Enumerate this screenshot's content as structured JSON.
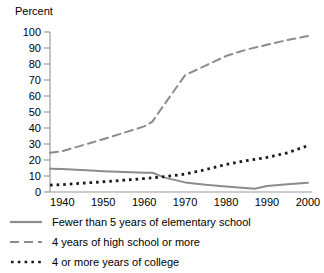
{
  "chart_data": {
    "type": "line",
    "title": "",
    "ylabel": "Percent",
    "xlabel": "",
    "ylim": [
      0,
      100
    ],
    "xlim": [
      1937,
      2001
    ],
    "grid": false,
    "legend_position": "below",
    "y_ticks": [
      0,
      10,
      20,
      30,
      40,
      50,
      60,
      70,
      80,
      90,
      100
    ],
    "y_tick_labels": [
      "0",
      "10",
      "20",
      "30",
      "40",
      "50",
      "60",
      "70",
      "80",
      "90",
      "100"
    ],
    "x_ticks": [
      1940,
      1950,
      1960,
      1970,
      1980,
      1990,
      2000
    ],
    "x_tick_labels": [
      "1940",
      "1950",
      "1960",
      "1970",
      "1980",
      "1990",
      "2000"
    ],
    "series": [
      {
        "name": "Fewer than 5 years of elementary school",
        "style": "solid",
        "color": "#8c8c8c",
        "x": [
          1937,
          1940,
          1947,
          1950,
          1957,
          1960,
          1962,
          1965,
          1970,
          1975,
          1980,
          1987,
          1990,
          1995,
          2000
        ],
        "values": [
          14.6,
          14.4,
          13.4,
          13.0,
          12.3,
          12.1,
          12.0,
          9.0,
          6.0,
          4.6,
          3.5,
          2.0,
          3.8,
          4.8,
          5.8
        ]
      },
      {
        "name": "4 years of high school or more",
        "style": "dashed",
        "color": "#8c8c8c",
        "x": [
          1937,
          1940,
          1950,
          1960,
          1962,
          1965,
          1970,
          1975,
          1980,
          1985,
          1990,
          1995,
          2000
        ],
        "values": [
          24.5,
          25.5,
          33.0,
          41.0,
          44.0,
          55.0,
          73.0,
          79.0,
          85.0,
          89.0,
          92.0,
          95.0,
          97.5
        ]
      },
      {
        "name": "4 or more years of college",
        "style": "dotted",
        "color": "#1a1a1a",
        "x": [
          1937,
          1940,
          1950,
          1960,
          1965,
          1970,
          1975,
          1980,
          1985,
          1990,
          1995,
          2000
        ],
        "values": [
          4.3,
          4.6,
          6.4,
          8.4,
          9.6,
          11.2,
          14.0,
          17.2,
          19.6,
          21.6,
          24.5,
          29.0
        ]
      }
    ]
  },
  "legend": {
    "items": [
      {
        "label": "Fewer than 5 years of elementary school",
        "swatch": "solid-line-swatch"
      },
      {
        "label": "4 years of high school or more",
        "swatch": "dashed-line-swatch"
      },
      {
        "label": "4 or more years of college",
        "swatch": "dotted-line-swatch"
      }
    ]
  }
}
